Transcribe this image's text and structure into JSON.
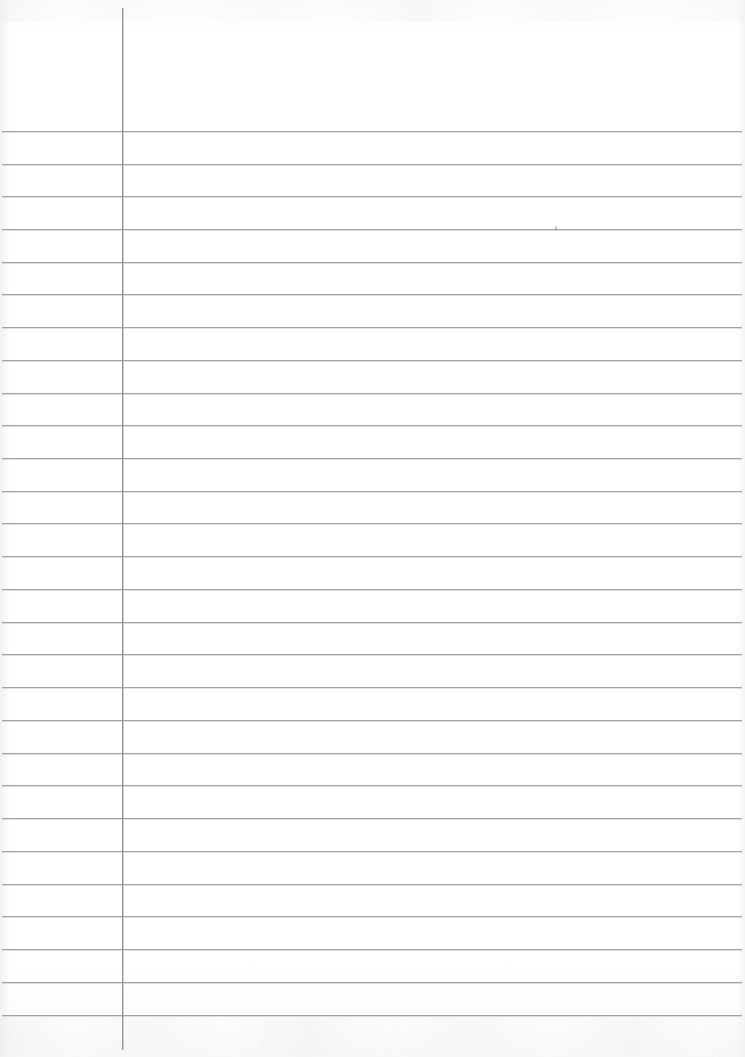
{
  "document": {
    "kind": "scanned-ruled-paper",
    "title": "Blank Ruled Notebook Page",
    "page_width": 745,
    "page_height": 1057,
    "body_text": "",
    "visible_text_content": []
  },
  "colors": {
    "paper": "#ffffff",
    "paper_tint": "#fbfbfc",
    "rule_line": "#9b9b9f",
    "margin_rule": "#8e8e93",
    "edge_shadow": "#eeeef1"
  },
  "ruling": {
    "line_count": 28,
    "first_line_y": 131,
    "line_spacing": 32.75,
    "line_left_x": 2,
    "line_right_x": 742,
    "line_thickness": 1,
    "margin_rule_x": 122,
    "margin_rule_top_y": 8,
    "margin_rule_bottom_y": 1050,
    "margin_rule_thickness": 1,
    "header_zone_height": 131,
    "lines_y": [
      131,
      164,
      196,
      229,
      262,
      294,
      327,
      360,
      393,
      425,
      458,
      491,
      523,
      556,
      589,
      622,
      654,
      687,
      720,
      753,
      785,
      818,
      851,
      884,
      916,
      949,
      982,
      1015
    ]
  },
  "artifacts": [
    {
      "name": "scan-speck",
      "x": 555,
      "y": 226,
      "w": 2,
      "h": 5
    }
  ]
}
